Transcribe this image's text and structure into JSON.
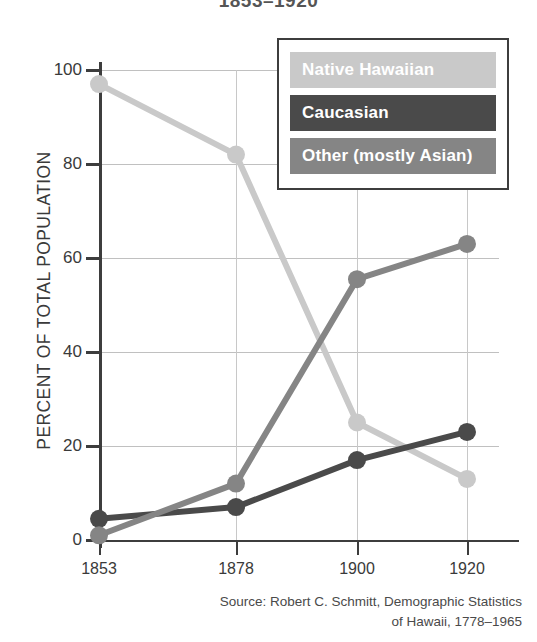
{
  "chart_data": {
    "type": "line",
    "title": "1853–1920",
    "xlabel": "",
    "ylabel": "PERCENT OF TOTAL POPULATION",
    "x": [
      1853,
      1878,
      1900,
      1920
    ],
    "categories": [
      "1853",
      "1878",
      "1900",
      "1920"
    ],
    "xlim": [
      1850,
      1923
    ],
    "ylim": [
      0,
      100
    ],
    "yticks": [
      0,
      20,
      40,
      60,
      80,
      100
    ],
    "ytick_labels": [
      "0",
      "20",
      "40",
      "60",
      "80",
      "100"
    ],
    "grid": true,
    "legend_position": "upper right",
    "series": [
      {
        "name": "Native Hawaiian",
        "color": "#c9c9c9",
        "values": [
          97,
          82,
          25,
          13
        ]
      },
      {
        "name": "Caucasian",
        "color": "#4a4a4a",
        "values": [
          4.5,
          7,
          17,
          23
        ]
      },
      {
        "name": "Other (mostly Asian)",
        "color": "#858585",
        "values": [
          1,
          12,
          55.5,
          63
        ]
      }
    ],
    "source_lines": [
      "Source: Robert C. Schmitt, Demographic Statistics",
      "of Hawaii, 1778–1965"
    ]
  },
  "legend": {
    "items": [
      {
        "label": "Native Hawaiian",
        "swatch": "#c9c9c9",
        "tone": "light"
      },
      {
        "label": "Caucasian",
        "swatch": "#4a4a4a",
        "tone": "dark"
      },
      {
        "label": "Other (mostly Asian)",
        "swatch": "#858585",
        "tone": "mid"
      }
    ]
  }
}
